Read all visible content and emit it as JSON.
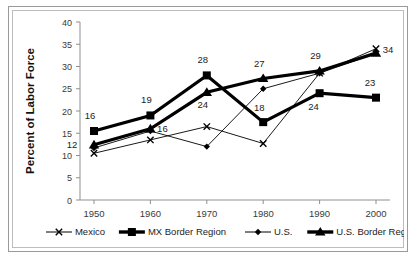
{
  "figure": {
    "caption": "",
    "frame_color": "#9a9a9a",
    "plot_border_color": "#bdbdbd",
    "ink_color": "#000000"
  },
  "chart_data": {
    "type": "line",
    "title": "",
    "xlabel": "",
    "ylabel": "Percent of Labor Force",
    "categories": [
      "1950",
      "1960",
      "1970",
      "1980",
      "1990",
      "2000"
    ],
    "x": [
      1950,
      1960,
      1970,
      1980,
      1990,
      2000
    ],
    "ylim": [
      0,
      40
    ],
    "yticks": [
      0,
      5,
      10,
      15,
      20,
      25,
      30,
      35,
      40
    ],
    "ytick_labels": [
      "0",
      "5",
      "10",
      "15",
      "20",
      "25",
      "30",
      "35",
      "40"
    ],
    "grid": false,
    "legend_position": "bottom",
    "series": [
      {
        "name": "Mexico",
        "marker": "x-marker",
        "line_weight": "thin",
        "values": [
          10.5,
          13.5,
          16.5,
          12.7,
          28.5,
          34.0
        ],
        "labels": [
          "",
          "",
          "",
          "",
          "",
          "34"
        ]
      },
      {
        "name": "MX Border Region",
        "marker": "square-marker",
        "line_weight": "thick",
        "values": [
          15.5,
          19.0,
          28.0,
          17.5,
          24.0,
          23.0
        ],
        "labels": [
          "16",
          "19",
          "28",
          "18",
          "24",
          "23"
        ]
      },
      {
        "name": "U.S.",
        "marker": "diamond-marker",
        "line_weight": "thin",
        "values": [
          11.7,
          15.5,
          12.0,
          25.0,
          28.5,
          33.0
        ],
        "labels": [
          "",
          "",
          "",
          "",
          "",
          ""
        ]
      },
      {
        "name": "U.S. Border Region",
        "marker": "triangle-marker",
        "line_weight": "thick",
        "values": [
          12.4,
          16.0,
          24.2,
          27.3,
          29.0,
          33.0
        ],
        "labels": [
          "12",
          "16",
          "24",
          "27",
          "29",
          ""
        ]
      }
    ],
    "point_labels": [
      {
        "text": "16",
        "x": 1950,
        "y": 15.5,
        "dx": -4,
        "dy": -12
      },
      {
        "text": "12",
        "x": 1950,
        "y": 12.4,
        "dx": -22,
        "dy": 3
      },
      {
        "text": "19",
        "x": 1960,
        "y": 19.0,
        "dx": -4,
        "dy": -12
      },
      {
        "text": "16",
        "x": 1960,
        "y": 16.0,
        "dx": 12,
        "dy": 3
      },
      {
        "text": "28",
        "x": 1970,
        "y": 28.0,
        "dx": -4,
        "dy": -12
      },
      {
        "text": "24",
        "x": 1970,
        "y": 24.2,
        "dx": -4,
        "dy": 16
      },
      {
        "text": "27",
        "x": 1980,
        "y": 27.3,
        "dx": -4,
        "dy": -12
      },
      {
        "text": "18",
        "x": 1980,
        "y": 17.5,
        "dx": -4,
        "dy": -11
      },
      {
        "text": "29",
        "x": 1990,
        "y": 29.0,
        "dx": -4,
        "dy": -12
      },
      {
        "text": "24",
        "x": 1990,
        "y": 24.0,
        "dx": -6,
        "dy": 17
      },
      {
        "text": "23",
        "x": 2000,
        "y": 23.0,
        "dx": -6,
        "dy": -12
      },
      {
        "text": "34",
        "x": 2000,
        "y": 34.0,
        "dx": 12,
        "dy": 4
      }
    ],
    "legend": [
      {
        "label": "Mexico",
        "marker": "x-marker",
        "line_weight": "thin"
      },
      {
        "label": "MX Border Region",
        "marker": "square-marker",
        "line_weight": "thick"
      },
      {
        "label": "U.S.",
        "marker": "diamond-marker",
        "line_weight": "thin"
      },
      {
        "label": "U.S. Border Region",
        "marker": "triangle-marker",
        "line_weight": "thick"
      }
    ]
  }
}
